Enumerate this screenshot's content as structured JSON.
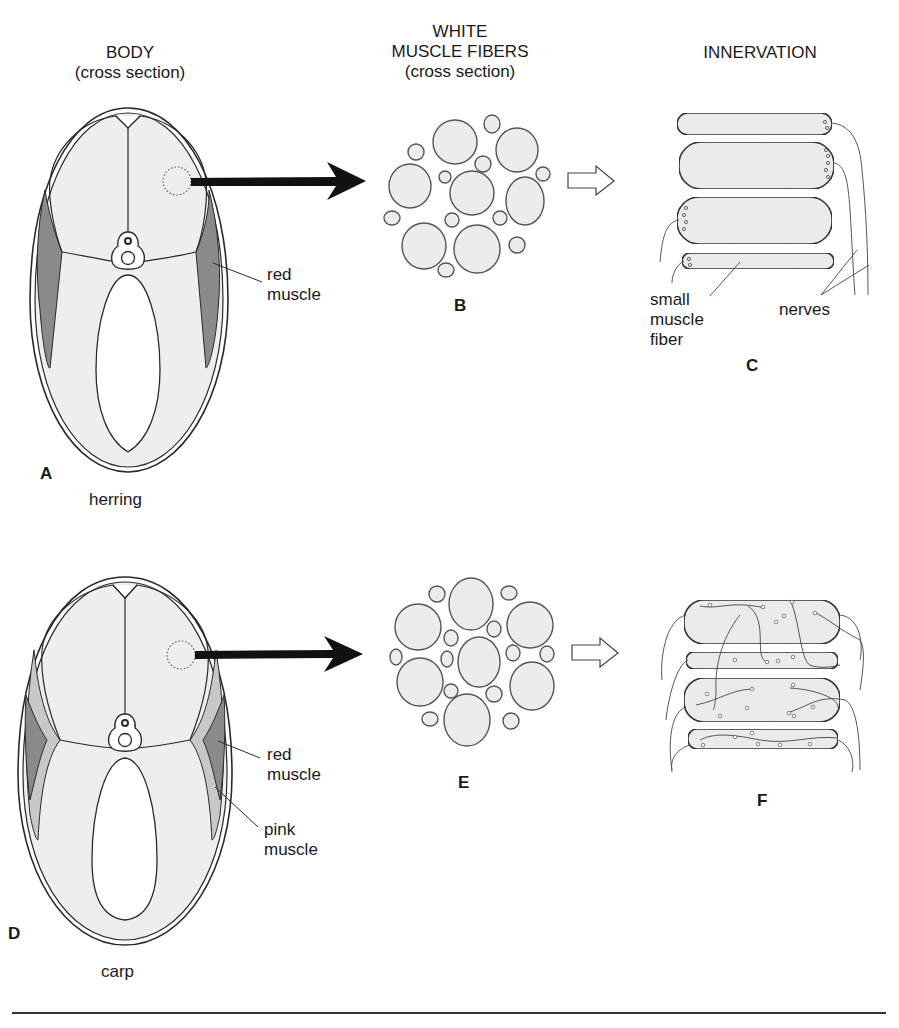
{
  "headers": {
    "body": {
      "line1": "BODY",
      "line2": "(cross section)"
    },
    "fibers": {
      "line1": "WHITE",
      "line2": "MUSCLE FIBERS",
      "line3": "(cross section)"
    },
    "innervation": {
      "line1": "INNERVATION"
    }
  },
  "rows": [
    {
      "species": "herring",
      "panels": {
        "body": "A",
        "fibers": "B",
        "innervation": "C"
      },
      "labels": {
        "red_muscle": [
          "red",
          "muscle"
        ],
        "small_fiber": [
          "small",
          "muscle",
          "fiber"
        ],
        "nerves": "nerves"
      }
    },
    {
      "species": "carp",
      "panels": {
        "body": "D",
        "fibers": "E",
        "innervation": "F"
      },
      "labels": {
        "red_muscle": [
          "red",
          "muscle"
        ],
        "pink_muscle": [
          "pink",
          "muscle"
        ]
      }
    }
  ],
  "colors": {
    "outline": "#2a2a2a",
    "flesh": "#eeeeee",
    "red_muscle": "#8a8a8a",
    "pink_muscle": "#c8c8c8",
    "fiber_fill": "#ececec",
    "arrow": "#111111"
  }
}
